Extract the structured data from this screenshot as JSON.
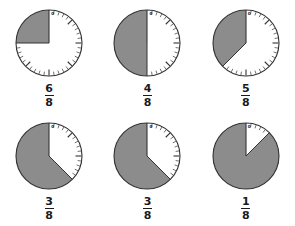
{
  "page": {
    "background_color": "#ffffff",
    "columns": 3,
    "rows": 2
  },
  "style": {
    "shaded_color": "#8c8c8c",
    "unshaded_color": "#ffffff",
    "outline_color": "#333333",
    "tick_color": "#333333",
    "text_color": "#1a1a1a",
    "origin_label": "0"
  },
  "chart_data": {
    "type": "pie",
    "xlabel": "",
    "ylabel": "",
    "denominator": 8,
    "sector_span_degrees": 45,
    "start_angle_degrees": 0,
    "direction": "clockwise-from-top",
    "unit_note": "Each dial is divided into 8 equal eighths; the white sector measured clockwise from 0 at the top gives the labeled fraction.",
    "items": [
      {
        "index": 1,
        "label": "6/8",
        "numerator": "6",
        "denominator": "8",
        "value": 0.75,
        "white_eighths": 6,
        "shaded_eighths": 2,
        "white_sweep_degrees": 270,
        "shaded_sweep_degrees": 90,
        "origin_label": "0"
      },
      {
        "index": 2,
        "label": "4/8",
        "numerator": "4",
        "denominator": "8",
        "value": 0.5,
        "white_eighths": 4,
        "shaded_eighths": 4,
        "white_sweep_degrees": 180,
        "shaded_sweep_degrees": 180,
        "origin_label": "0"
      },
      {
        "index": 3,
        "label": "5/8",
        "numerator": "5",
        "denominator": "8",
        "value": 0.625,
        "white_eighths": 5,
        "shaded_eighths": 3,
        "white_sweep_degrees": 225,
        "shaded_sweep_degrees": 135,
        "origin_label": "0"
      },
      {
        "index": 4,
        "label": "3/8",
        "numerator": "3",
        "denominator": "8",
        "value": 0.375,
        "white_eighths": 3,
        "shaded_eighths": 5,
        "white_sweep_degrees": 135,
        "shaded_sweep_degrees": 225,
        "origin_label": "0"
      },
      {
        "index": 5,
        "label": "3/8",
        "numerator": "3",
        "denominator": "8",
        "value": 0.375,
        "white_eighths": 3,
        "shaded_eighths": 5,
        "white_sweep_degrees": 135,
        "shaded_sweep_degrees": 225,
        "origin_label": "0"
      },
      {
        "index": 6,
        "label": "1/8",
        "numerator": "1",
        "denominator": "8",
        "value": 0.125,
        "white_eighths": 1,
        "shaded_eighths": 7,
        "white_sweep_degrees": 45,
        "shaded_sweep_degrees": 315,
        "origin_label": "0"
      }
    ]
  }
}
